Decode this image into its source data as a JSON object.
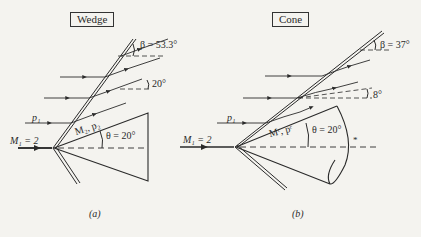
{
  "panels": [
    {
      "id": "a",
      "title": "Wedge",
      "caption": "(a)",
      "upstream_mach": "M₁ = 2",
      "upstream_pressure": "p₁",
      "downstream_label": "M₂, p₂",
      "shock_angle": "β = 53.3°",
      "flow_deflection": "20°",
      "half_angle": "θ = 20°"
    },
    {
      "id": "b",
      "title": "Cone",
      "caption": "(b)",
      "upstream_mach": "M₁ = 2",
      "upstream_pressure": "p₁",
      "downstream_label": "Mᶜ, pᶜ",
      "shock_angle": "β = 37°",
      "flow_deflection": "8°",
      "half_angle": "θ = 20°",
      "marker": "*"
    }
  ],
  "colors": {
    "background": "#f4f3ef",
    "ink": "#2a2a2a"
  }
}
